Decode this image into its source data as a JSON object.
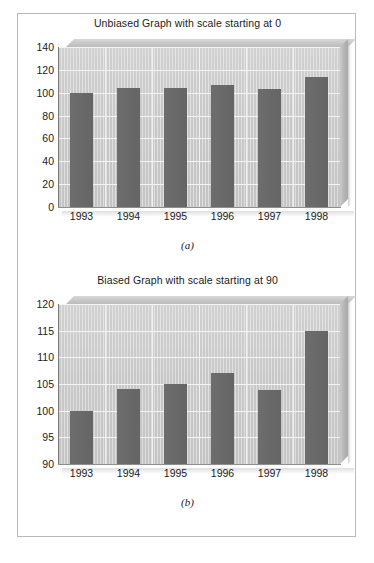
{
  "figure": {
    "background_color": "#ffffff",
    "frame_color": "#b9b9b9",
    "bar_color": "#6a6a6a",
    "plot_background_color": "#cacaca",
    "gridline_color": "#f4f4f4",
    "text_color": "#1b1b1b"
  },
  "panel_a": {
    "title": "Unbiased Graph with scale starting at 0",
    "caption": "(a)"
  },
  "panel_b": {
    "title": "Biased Graph with scale starting at 90",
    "caption": "(b)"
  },
  "chart_data": [
    {
      "id": "panel-a",
      "type": "bar",
      "title": "Unbiased Graph with scale starting at 0",
      "caption": "(a)",
      "xlabel": "",
      "ylabel": "",
      "categories": [
        "1993",
        "1994",
        "1995",
        "1996",
        "1997",
        "1998"
      ],
      "values": [
        100,
        104,
        104,
        107,
        103.5,
        113.5
      ],
      "ylim": [
        0,
        140
      ],
      "yticks": [
        0,
        20,
        40,
        60,
        80,
        100,
        120,
        140
      ],
      "ytick_labels": [
        "0",
        "20",
        "40",
        "60",
        "80",
        "100",
        "120",
        "140"
      ],
      "grid": true,
      "legend": false,
      "style": "3d-bar",
      "series": [
        {
          "name": "Value",
          "values": [
            100,
            104,
            104,
            107,
            103.5,
            113.5
          ]
        }
      ]
    },
    {
      "id": "panel-b",
      "type": "bar",
      "title": "Biased Graph with scale starting at 90",
      "caption": "(b)",
      "xlabel": "",
      "ylabel": "",
      "categories": [
        "1993",
        "1994",
        "1995",
        "1996",
        "1997",
        "1998"
      ],
      "values": [
        100,
        104,
        105,
        107,
        103.8,
        115
      ],
      "ylim": [
        90,
        120
      ],
      "yticks": [
        90,
        95,
        100,
        105,
        110,
        115,
        120
      ],
      "ytick_labels": [
        "90",
        "95",
        "100",
        "105",
        "110",
        "115",
        "120"
      ],
      "grid": true,
      "legend": false,
      "style": "3d-bar",
      "series": [
        {
          "name": "Value",
          "values": [
            100,
            104,
            105,
            107,
            103.8,
            115
          ]
        }
      ]
    }
  ]
}
